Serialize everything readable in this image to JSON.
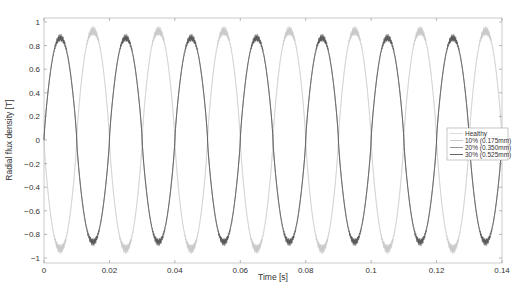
{
  "chart_data": {
    "type": "line",
    "title": "",
    "xlabel": "Time [s]",
    "ylabel": "Radial flux density [T]",
    "xlim": [
      0,
      0.14
    ],
    "ylim": [
      -1.05,
      1.05
    ],
    "xticks": [
      0,
      0.02,
      0.04,
      0.06,
      0.08,
      0.1,
      0.12,
      0.14
    ],
    "xtick_labels": [
      "0",
      "0.02",
      "0.04",
      "0.06",
      "0.08",
      "0.1",
      "0.12",
      "0.14"
    ],
    "yticks": [
      1,
      0.8,
      0.6,
      0.4,
      0.2,
      0,
      -0.2,
      -0.4,
      -0.6,
      -0.8,
      -1
    ],
    "ytick_labels": [
      "1",
      "0.8",
      "0.6",
      "0.4",
      "0.2",
      "0",
      "-0.2",
      "-0.4",
      "-0.6",
      "-0.8",
      "-1"
    ],
    "grid": false,
    "legend_position": "center right",
    "frequency_hz": 50,
    "series": [
      {
        "name": "Healthy",
        "color": "#d8d8d8",
        "amplitude": 0.97,
        "phase_sign": -1,
        "slot_ripple": 0.09
      },
      {
        "name": "10% (0.175mm)",
        "color": "#c4c4c4",
        "amplitude": 0.96,
        "phase_sign": -1,
        "slot_ripple": 0.08
      },
      {
        "name": "20% (0.350mm)",
        "color": "#8a8a8a",
        "amplitude": 0.9,
        "phase_sign": 1,
        "slot_ripple": 0.06
      },
      {
        "name": "30% (0.525mm)",
        "color": "#555555",
        "amplitude": 0.89,
        "phase_sign": 1,
        "slot_ripple": 0.06
      }
    ],
    "x_sample": [
      0,
      0.005,
      0.01,
      0.015,
      0.02,
      0.025,
      0.03,
      0.035,
      0.04,
      0.045,
      0.05,
      0.055,
      0.06,
      0.065,
      0.07,
      0.075,
      0.08,
      0.085,
      0.09,
      0.095,
      0.1,
      0.105,
      0.11,
      0.115,
      0.12,
      0.125,
      0.13,
      0.135,
      0.14
    ],
    "series_peaks_sample": {
      "Healthy": [
        0,
        -1.0,
        0,
        1.0,
        0,
        -1.0,
        0,
        1.0,
        0,
        -1.0,
        0,
        1.0,
        0,
        -1.0,
        0,
        1.0,
        0,
        -1.0,
        0,
        1.0,
        0,
        -1.0,
        0,
        1.0,
        0,
        -1.0,
        0,
        1.0,
        0
      ],
      "30% (0.525mm)": [
        0,
        0.92,
        0,
        -0.92,
        0,
        0.92,
        0,
        -0.92,
        0,
        0.92,
        0,
        -0.92,
        0,
        0.92,
        0,
        -0.92,
        0,
        0.92,
        0,
        -0.92,
        0,
        0.92,
        0,
        -0.92,
        0,
        0.92,
        0,
        -0.92,
        0
      ]
    }
  },
  "legend": {
    "items": [
      {
        "label": "Healthy",
        "color": "#d8d8d8"
      },
      {
        "label": "10% (0.175mm)",
        "color": "#c4c4c4"
      },
      {
        "label": "20% (0.350mm)",
        "color": "#8a8a8a"
      },
      {
        "label": "30% (0.525mm)",
        "color": "#555555"
      }
    ]
  }
}
